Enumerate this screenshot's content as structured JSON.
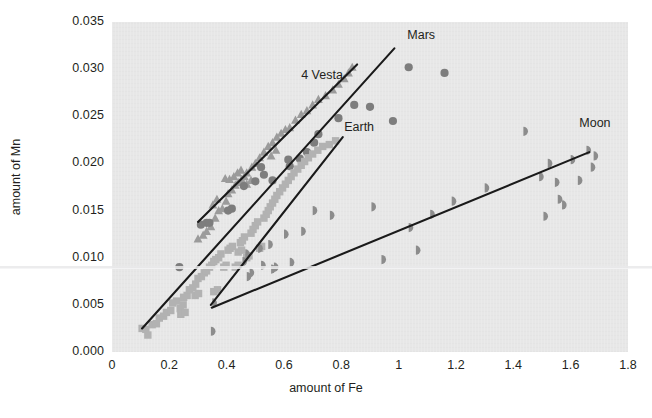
{
  "figure": {
    "background": "#ffffff",
    "plot_background": "#e7e7e7",
    "artifact_line_color": "#e9e9ea"
  },
  "axis_titles": {
    "x": "amount of Fe",
    "y": "amount of Mn"
  },
  "chart_data": {
    "type": "scatter",
    "title": "",
    "xlabel": "amount of Fe",
    "ylabel": "amount of Mn",
    "xlim": [
      0,
      1.8
    ],
    "ylim": [
      0.0,
      0.035
    ],
    "xticks": [
      0,
      0.2,
      0.4,
      0.6,
      0.8,
      1,
      1.2,
      1.4,
      1.6,
      1.8
    ],
    "xticklabels": [
      "0",
      "0.2",
      "0.4",
      "0.6",
      "0.8",
      "1",
      "1.2",
      "1.4",
      "1.6",
      "1.8"
    ],
    "yticks": [
      0.0,
      0.005,
      0.01,
      0.015,
      0.02,
      0.025,
      0.03,
      0.035
    ],
    "yticklabels": [
      "0.000",
      "0.005",
      "0.010",
      "0.015",
      "0.020",
      "0.025",
      "0.030",
      "0.035"
    ],
    "grid": false,
    "legend": "inline-annotations",
    "series": [
      {
        "name": "4 Vesta",
        "marker": "triangle",
        "color": "#9b9b9b",
        "label_x": 0.66,
        "label_y": 0.0293,
        "trend_line": {
          "x1": 0.3,
          "y1": 0.0138,
          "x2": 0.855,
          "y2": 0.0305
        },
        "points": [
          [
            0.33,
            0.0128
          ],
          [
            0.345,
            0.0133
          ],
          [
            0.36,
            0.0142
          ],
          [
            0.372,
            0.015
          ],
          [
            0.385,
            0.0152
          ],
          [
            0.398,
            0.016
          ],
          [
            0.405,
            0.0168
          ],
          [
            0.418,
            0.0172
          ],
          [
            0.43,
            0.0177
          ],
          [
            0.44,
            0.018
          ],
          [
            0.452,
            0.0183
          ],
          [
            0.462,
            0.0186
          ],
          [
            0.47,
            0.019
          ],
          [
            0.395,
            0.0184
          ],
          [
            0.41,
            0.0183
          ],
          [
            0.425,
            0.0186
          ],
          [
            0.438,
            0.019
          ],
          [
            0.45,
            0.0193
          ],
          [
            0.352,
            0.0156
          ],
          [
            0.366,
            0.0162
          ],
          [
            0.488,
            0.0196
          ],
          [
            0.5,
            0.02
          ],
          [
            0.515,
            0.0206
          ],
          [
            0.53,
            0.0212
          ],
          [
            0.545,
            0.0218
          ],
          [
            0.56,
            0.0222
          ],
          [
            0.575,
            0.0228
          ],
          [
            0.59,
            0.0232
          ],
          [
            0.605,
            0.0236
          ],
          [
            0.62,
            0.0238
          ],
          [
            0.64,
            0.0246
          ],
          [
            0.66,
            0.0252
          ],
          [
            0.68,
            0.0256
          ],
          [
            0.7,
            0.0262
          ],
          [
            0.72,
            0.0268
          ],
          [
            0.745,
            0.0272
          ],
          [
            0.77,
            0.0278
          ],
          [
            0.79,
            0.0284
          ],
          [
            0.81,
            0.029
          ],
          [
            0.825,
            0.0296
          ],
          [
            0.838,
            0.0302
          ],
          [
            0.3,
            0.012
          ],
          [
            0.318,
            0.0124
          ],
          [
            0.47,
            0.0178
          ],
          [
            0.485,
            0.0182
          ],
          [
            0.555,
            0.0208
          ],
          [
            0.572,
            0.0214
          ]
        ]
      },
      {
        "name": "Mars",
        "marker": "circle",
        "color": "#7d7d7d",
        "label_x": 1.03,
        "label_y": 0.0335,
        "trend_line": {
          "x1": 0.105,
          "y1": 0.0025,
          "x2": 0.985,
          "y2": 0.0322
        },
        "points": [
          [
            0.235,
            0.009
          ],
          [
            0.31,
            0.0135
          ],
          [
            0.33,
            0.0137
          ],
          [
            0.34,
            0.0137
          ],
          [
            0.405,
            0.015
          ],
          [
            0.418,
            0.0152
          ],
          [
            0.46,
            0.0176
          ],
          [
            0.5,
            0.0181
          ],
          [
            0.52,
            0.0196
          ],
          [
            0.56,
            0.0182
          ],
          [
            0.62,
            0.0197
          ],
          [
            0.655,
            0.0205
          ],
          [
            0.68,
            0.0212
          ],
          [
            0.705,
            0.0222
          ],
          [
            0.72,
            0.0231
          ],
          [
            0.79,
            0.0248
          ],
          [
            0.845,
            0.0262
          ],
          [
            0.9,
            0.026
          ],
          [
            0.98,
            0.0245
          ],
          [
            1.035,
            0.0302
          ],
          [
            1.16,
            0.0296
          ],
          [
            0.615,
            0.0204
          ],
          [
            0.53,
            0.0188
          ]
        ]
      },
      {
        "name": "Earth",
        "marker": "square",
        "color": "#b2b2b2",
        "label_x": 0.81,
        "label_y": 0.0238,
        "trend_line": {
          "x1": 0.345,
          "y1": 0.005,
          "x2": 0.805,
          "y2": 0.0228
        },
        "points": [
          [
            0.105,
            0.0025
          ],
          [
            0.118,
            0.0024
          ],
          [
            0.125,
            0.0018
          ],
          [
            0.14,
            0.0029
          ],
          [
            0.155,
            0.003
          ],
          [
            0.165,
            0.0036
          ],
          [
            0.18,
            0.0038
          ],
          [
            0.19,
            0.0042
          ],
          [
            0.205,
            0.0044
          ],
          [
            0.212,
            0.0052
          ],
          [
            0.225,
            0.0054
          ],
          [
            0.238,
            0.0046
          ],
          [
            0.248,
            0.005
          ],
          [
            0.25,
            0.0058
          ],
          [
            0.262,
            0.006
          ],
          [
            0.27,
            0.0066
          ],
          [
            0.282,
            0.0068
          ],
          [
            0.292,
            0.0072
          ],
          [
            0.3,
            0.0078
          ],
          [
            0.312,
            0.008
          ],
          [
            0.322,
            0.0084
          ],
          [
            0.33,
            0.0086
          ],
          [
            0.34,
            0.009
          ],
          [
            0.348,
            0.0092
          ],
          [
            0.355,
            0.0096
          ],
          [
            0.362,
            0.0098
          ],
          [
            0.372,
            0.01
          ],
          [
            0.38,
            0.0104
          ],
          [
            0.39,
            0.009
          ],
          [
            0.398,
            0.0092
          ],
          [
            0.405,
            0.0108
          ],
          [
            0.412,
            0.011
          ],
          [
            0.42,
            0.0112
          ],
          [
            0.43,
            0.009
          ],
          [
            0.44,
            0.0092
          ],
          [
            0.448,
            0.0116
          ],
          [
            0.455,
            0.0118
          ],
          [
            0.462,
            0.0122
          ],
          [
            0.47,
            0.01
          ],
          [
            0.478,
            0.0102
          ],
          [
            0.485,
            0.0126
          ],
          [
            0.492,
            0.013
          ],
          [
            0.5,
            0.0134
          ],
          [
            0.508,
            0.0138
          ],
          [
            0.515,
            0.011
          ],
          [
            0.522,
            0.0112
          ],
          [
            0.53,
            0.0142
          ],
          [
            0.538,
            0.0146
          ],
          [
            0.545,
            0.015
          ],
          [
            0.552,
            0.0154
          ],
          [
            0.56,
            0.0158
          ],
          [
            0.568,
            0.0162
          ],
          [
            0.575,
            0.0166
          ],
          [
            0.585,
            0.017
          ],
          [
            0.595,
            0.0174
          ],
          [
            0.605,
            0.0178
          ],
          [
            0.615,
            0.0182
          ],
          [
            0.625,
            0.0186
          ],
          [
            0.635,
            0.019
          ],
          [
            0.648,
            0.0194
          ],
          [
            0.66,
            0.0198
          ],
          [
            0.672,
            0.0202
          ],
          [
            0.685,
            0.0206
          ],
          [
            0.7,
            0.021
          ],
          [
            0.718,
            0.0214
          ],
          [
            0.735,
            0.0218
          ],
          [
            0.758,
            0.022
          ],
          [
            0.78,
            0.0224
          ],
          [
            0.355,
            0.0064
          ],
          [
            0.368,
            0.0066
          ],
          [
            0.29,
            0.006
          ],
          [
            0.302,
            0.0062
          ],
          [
            0.24,
            0.004
          ],
          [
            0.255,
            0.0042
          ],
          [
            0.44,
            0.0106
          ],
          [
            0.452,
            0.0108
          ]
        ]
      },
      {
        "name": "Moon",
        "marker": "half-circle",
        "color": "#8c8c8c",
        "label_x": 1.63,
        "label_y": 0.0242,
        "trend_line": {
          "x1": 0.348,
          "y1": 0.0047,
          "x2": 1.665,
          "y2": 0.0212
        },
        "points": [
          [
            0.345,
            0.0022
          ],
          [
            0.35,
            0.0052
          ],
          [
            0.455,
            0.0096
          ],
          [
            0.465,
            0.0104
          ],
          [
            0.47,
            0.008
          ],
          [
            0.48,
            0.0084
          ],
          [
            0.51,
            0.011
          ],
          [
            0.52,
            0.0092
          ],
          [
            0.545,
            0.0114
          ],
          [
            0.555,
            0.0088
          ],
          [
            0.565,
            0.009
          ],
          [
            0.6,
            0.0125
          ],
          [
            0.62,
            0.0095
          ],
          [
            0.66,
            0.0128
          ],
          [
            0.7,
            0.015
          ],
          [
            0.76,
            0.0145
          ],
          [
            0.905,
            0.0154
          ],
          [
            0.94,
            0.0098
          ],
          [
            1.035,
            0.0132
          ],
          [
            1.06,
            0.0108
          ],
          [
            1.11,
            0.0146
          ],
          [
            1.185,
            0.016
          ],
          [
            1.3,
            0.0174
          ],
          [
            1.435,
            0.0234
          ],
          [
            1.49,
            0.0186
          ],
          [
            1.505,
            0.0144
          ],
          [
            1.52,
            0.02
          ],
          [
            1.545,
            0.018
          ],
          [
            1.555,
            0.0162
          ],
          [
            1.57,
            0.0156
          ],
          [
            1.6,
            0.0204
          ],
          [
            1.625,
            0.0182
          ],
          [
            1.655,
            0.0214
          ],
          [
            1.67,
            0.0196
          ],
          [
            1.68,
            0.0208
          ]
        ]
      }
    ]
  }
}
